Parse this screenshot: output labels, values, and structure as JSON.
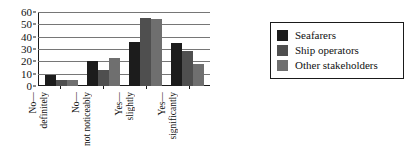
{
  "chart_data": {
    "type": "bar",
    "title": "",
    "subtitle": "",
    "xlabel": "",
    "ylabel": "",
    "ylim": [
      0,
      60
    ],
    "yticks": [
      0,
      10,
      20,
      30,
      40,
      50,
      60
    ],
    "grid": true,
    "legend_position": "right",
    "categories": [
      "No — definitely",
      "No — not noticeably",
      "Yes — slightly",
      "Yes — significantly"
    ],
    "series": [
      {
        "name": "Seafarers",
        "color": "#1c1c1c",
        "values": [
          9,
          20,
          36,
          35
        ]
      },
      {
        "name": "Ship operators",
        "color": "#4f4f4f",
        "values": [
          5,
          13,
          55,
          28
        ]
      },
      {
        "name": "Other stakeholders",
        "color": "#6f6f6f",
        "values": [
          5,
          23,
          54,
          18
        ]
      }
    ]
  },
  "legend": {
    "items": [
      {
        "label": "Seafarers"
      },
      {
        "label": "Ship operators"
      },
      {
        "label": "Other stakeholders"
      }
    ]
  }
}
